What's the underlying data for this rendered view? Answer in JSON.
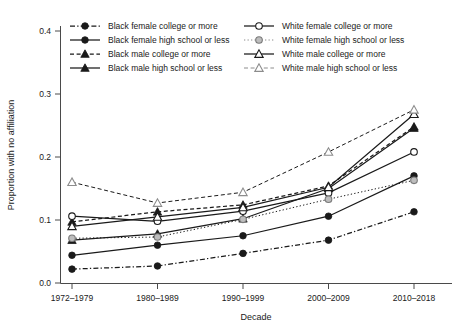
{
  "chart_data": {
    "type": "line",
    "title": "",
    "xlabel": "Decade",
    "ylabel": "Proportion with no affiliation",
    "categories": [
      "1972–1979",
      "1980–1989",
      "1990–1999",
      "2000–2009",
      "2010–2018"
    ],
    "ylim": [
      0.0,
      0.4
    ],
    "yticks": [
      "0.0",
      "0.1",
      "0.2",
      "0.3",
      "0.4"
    ],
    "ytick_values": [
      0.0,
      0.1,
      0.2,
      0.3,
      0.4
    ],
    "grid": false,
    "legend_position": "top",
    "series": [
      {
        "name": "Black female college or more",
        "marker": "filled-circle",
        "color": "#1a1a1a",
        "linestyle": "dashdot",
        "values": [
          0.022,
          0.027,
          0.047,
          0.068,
          0.113
        ]
      },
      {
        "name": "Black female high school or less",
        "marker": "filled-circle",
        "color": "#1a1a1a",
        "linestyle": "solid",
        "values": [
          0.044,
          0.06,
          0.075,
          0.106,
          0.17
        ]
      },
      {
        "name": "Black male college or more",
        "marker": "filled-triangle",
        "color": "#1a1a1a",
        "linestyle": "dashed",
        "values": [
          0.097,
          0.113,
          0.124,
          0.154,
          0.248
        ]
      },
      {
        "name": "Black male high school or less",
        "marker": "filled-triangle",
        "color": "#1a1a1a",
        "linestyle": "solid",
        "values": [
          0.068,
          0.078,
          0.102,
          0.15,
          0.246
        ]
      },
      {
        "name": "White female college or more",
        "marker": "open-circle",
        "color": "#1a1a1a",
        "linestyle": "solid",
        "values": [
          0.106,
          0.098,
          0.114,
          0.143,
          0.208
        ]
      },
      {
        "name": "White female high school or less",
        "marker": "gray-circle",
        "color": "#8c8c8c",
        "linestyle": "dotted",
        "values": [
          0.071,
          0.073,
          0.101,
          0.133,
          0.163
        ]
      },
      {
        "name": "White male college or more",
        "marker": "open-triangle",
        "color": "#1a1a1a",
        "linestyle": "solid",
        "values": [
          0.09,
          0.105,
          0.12,
          0.152,
          0.268
        ]
      },
      {
        "name": "White male high school or less",
        "marker": "open-triangle",
        "color": "#8c8c8c",
        "linestyle": "dashed",
        "values": [
          0.16,
          0.127,
          0.144,
          0.208,
          0.275
        ]
      }
    ]
  },
  "legend": {
    "column_left": [
      "Black female college or more",
      "Black female high school or less",
      "Black male college or more",
      "Black male high school or less"
    ],
    "column_right": [
      "White female college or more",
      "White female high school or less",
      "White male college or more",
      "White male high school or less"
    ]
  },
  "axes": {
    "y_title": "Proportion with no affiliation",
    "x_title": "Decade",
    "y_tick_0": "0.0",
    "y_tick_1": "0.1",
    "y_tick_2": "0.2",
    "y_tick_3": "0.3",
    "y_tick_4": "0.4",
    "x_tick_0": "1972–1979",
    "x_tick_1": "1980–1989",
    "x_tick_2": "1990–1999",
    "x_tick_3": "2000–2009",
    "x_tick_4": "2010–2018"
  }
}
